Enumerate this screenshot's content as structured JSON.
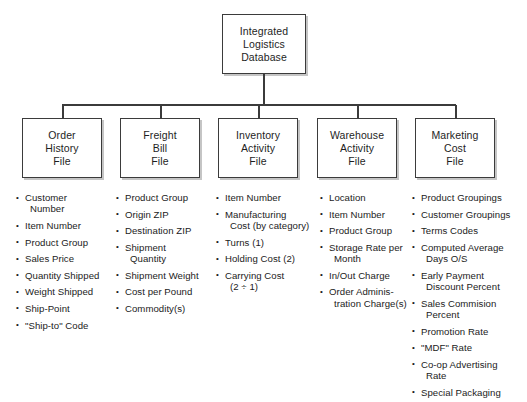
{
  "diagram": {
    "root": {
      "lines": [
        "Integrated",
        "Logistics",
        "Database"
      ]
    },
    "files": [
      {
        "lines": [
          "Order",
          "History",
          "File"
        ]
      },
      {
        "lines": [
          "Freight",
          "Bill",
          "File"
        ]
      },
      {
        "lines": [
          "Inventory",
          "Activity",
          "File"
        ]
      },
      {
        "lines": [
          "Warehouse",
          "Activity",
          "File"
        ]
      },
      {
        "lines": [
          "Marketing",
          "Cost",
          "File"
        ]
      }
    ],
    "columns": [
      {
        "items": [
          {
            "line1": "Customer",
            "line2": "Number"
          },
          {
            "line1": "Item Number"
          },
          {
            "line1": "Product Group"
          },
          {
            "line1": "Sales Price"
          },
          {
            "line1": "Quantity Shipped"
          },
          {
            "line1": "Weight Shipped"
          },
          {
            "line1": "Ship-Point"
          },
          {
            "line1": "\"Ship-to\" Code"
          }
        ]
      },
      {
        "items": [
          {
            "line1": "Product Group"
          },
          {
            "line1": "Origin ZIP"
          },
          {
            "line1": "Destination ZIP"
          },
          {
            "line1": "Shipment",
            "line2": "Quantity"
          },
          {
            "line1": "Shipment Weight"
          },
          {
            "line1": "Cost per Pound"
          },
          {
            "line1": "Commodity(s)"
          }
        ]
      },
      {
        "items": [
          {
            "line1": "Item Number"
          },
          {
            "line1": "Manufacturing",
            "line2": "Cost (by category)"
          },
          {
            "line1": "Turns (1)"
          },
          {
            "line1": "Holding Cost (2)"
          },
          {
            "line1": "Carrying Cost",
            "line2": "(2 ÷ 1)"
          }
        ]
      },
      {
        "items": [
          {
            "line1": "Location"
          },
          {
            "line1": "Item Number"
          },
          {
            "line1": "Product Group"
          },
          {
            "line1": "Storage Rate per",
            "line2": "Month"
          },
          {
            "line1": "In/Out Charge"
          },
          {
            "line1": "Order Adminis-",
            "line2": "tration Charge(s)"
          }
        ]
      },
      {
        "items": [
          {
            "line1": "Product Groupings"
          },
          {
            "line1": "Customer Groupings"
          },
          {
            "line1": "Terms Codes"
          },
          {
            "line1": "Computed Average",
            "line2": "Days O/S"
          },
          {
            "line1": "Early Payment",
            "line2": "Discount Percent"
          },
          {
            "line1": "Sales Commision",
            "line2": "Percent"
          },
          {
            "line1": "Promotion Rate"
          },
          {
            "line1": "\"MDF\" Rate"
          },
          {
            "line1": "Co-op Advertising",
            "line2": "Rate"
          },
          {
            "line1": "Special Packaging"
          }
        ]
      }
    ]
  }
}
